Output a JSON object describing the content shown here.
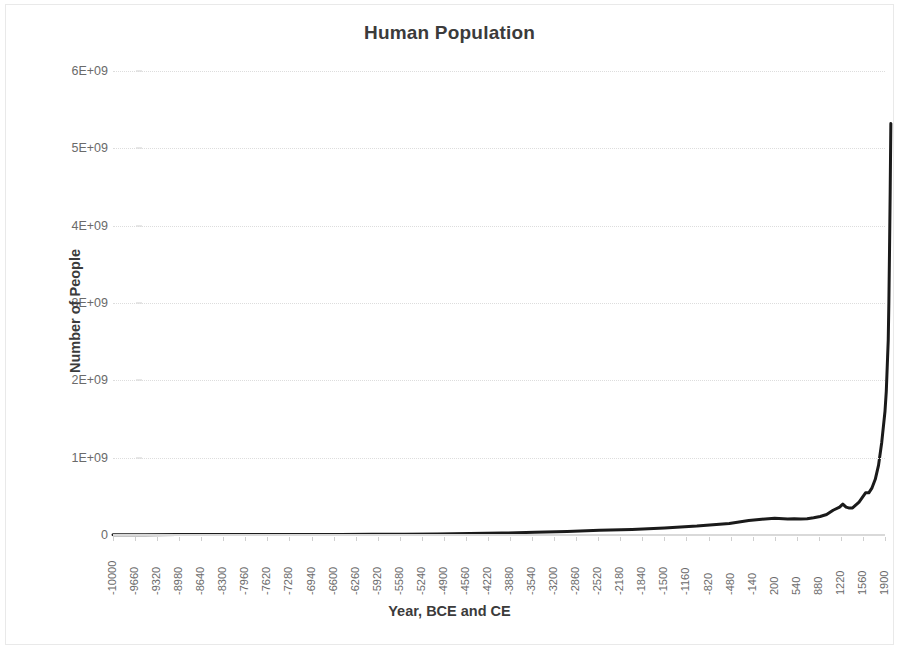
{
  "chart_data": {
    "type": "line",
    "title": "Human Population",
    "xlabel": "Year, BCE and CE",
    "ylabel": "Number of People",
    "xlim": [
      -10000,
      1900
    ],
    "ylim": [
      0,
      6000000000
    ],
    "grid": true,
    "legend": false,
    "line_color": "#1a1a1a",
    "line_width": 3,
    "y_tick_labels": [
      "0",
      "1E+09",
      "2E+09",
      "3E+09",
      "4E+09",
      "5E+09",
      "6E+09"
    ],
    "y_tick_values": [
      0,
      1000000000,
      2000000000,
      3000000000,
      4000000000,
      5000000000,
      6000000000
    ],
    "x_tick_step": 340,
    "x_tick_labels": [
      "-10000",
      "-9660",
      "-9320",
      "-8980",
      "-8640",
      "-8300",
      "-7960",
      "-7620",
      "-7280",
      "-6940",
      "-6600",
      "-6260",
      "-5920",
      "-5580",
      "-5240",
      "-4900",
      "-4560",
      "-4220",
      "-3880",
      "-3540",
      "-3200",
      "-2860",
      "-2520",
      "-2180",
      "-1840",
      "-1500",
      "-1160",
      "-820",
      "-480",
      "-140",
      "200",
      "540",
      "880",
      "1220",
      "1560",
      "1900"
    ],
    "x": [
      -10000,
      -9500,
      -9000,
      -8500,
      -8000,
      -7500,
      -7000,
      -6500,
      -6000,
      -5500,
      -5000,
      -4500,
      -4000,
      -3500,
      -3000,
      -2500,
      -2000,
      -1500,
      -1000,
      -800,
      -500,
      -400,
      -200,
      0,
      200,
      400,
      500,
      600,
      700,
      800,
      900,
      1000,
      1100,
      1200,
      1250,
      1300,
      1340,
      1400,
      1500,
      1600,
      1650,
      1700,
      1750,
      1800,
      1850,
      1900,
      1920,
      1940,
      1950,
      1960,
      1970,
      1980,
      1990
    ],
    "values": [
      4000000,
      4500000,
      5000000,
      5500000,
      6000000,
      6500000,
      7000000,
      8000000,
      9000000,
      11000000,
      14000000,
      18000000,
      25000000,
      35000000,
      45000000,
      60000000,
      72000000,
      90000000,
      115000000,
      130000000,
      150000000,
      162000000,
      188000000,
      205000000,
      215000000,
      206000000,
      210000000,
      206000000,
      210000000,
      224000000,
      240000000,
      265000000,
      320000000,
      360000000,
      400000000,
      360000000,
      350000000,
      350000000,
      425000000,
      545000000,
      545000000,
      610000000,
      720000000,
      900000000,
      1200000000,
      1600000000,
      1860000000,
      2300000000,
      2520000000,
      3020000000,
      3700000000,
      4440000000,
      5320000000
    ],
    "annotations": []
  }
}
